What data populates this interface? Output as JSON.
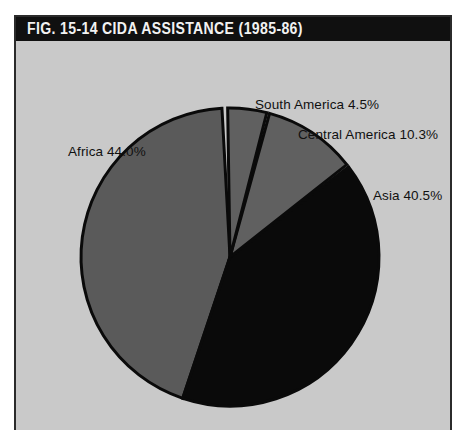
{
  "figure": {
    "number": "FIG. 15-14",
    "title": "CIDA ASSISTANCE (1985-86)",
    "title_full": "FIG. 15-14   CIDA ASSISTANCE (1985-86)",
    "source": "Source: CIDA",
    "panel_bg": "#c9c9c9",
    "titlebar_bg": "#101010",
    "titlebar_fg": "#f2f2f2"
  },
  "labels": {
    "africa": "Africa 44.0%",
    "south_america": "South America 4.5%",
    "central_america": "Central America 10.3%",
    "asia": "Asia 40.5%"
  },
  "chart_data": {
    "type": "pie",
    "title": "CIDA ASSISTANCE (1985-86)",
    "xlabel": "",
    "ylabel": "",
    "legend": "none",
    "grid": false,
    "units": "percent",
    "source": "Source: CIDA",
    "categories": [
      "Africa",
      "South America",
      "Central America",
      "Asia"
    ],
    "values": [
      44.0,
      4.5,
      10.3,
      40.5
    ],
    "labels": [
      "Africa 44.0%",
      "South America 4.5%",
      "Central America 10.3%",
      "Asia 40.5%"
    ],
    "colors": [
      "#5a5a5a",
      "#606060",
      "#606060",
      "#0a0a0a"
    ],
    "slice_separator_color": "#0a0a0a",
    "start_angle_deg": -2,
    "direction": "counterclockwise",
    "total": 99.3
  }
}
